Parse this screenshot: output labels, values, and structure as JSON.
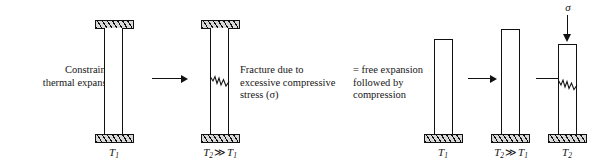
{
  "figure": {
    "background_color": "#ffffff",
    "line_color": "#111111",
    "hatch_fill_color": "#d8d8d8"
  },
  "captions": {
    "constraint": "Constraint of\nthermal expansion",
    "fracture": "Fracture due to\nexcessive compressive\nstress (σ)",
    "equivalence": "= free expansion\nfollowed by\ncompression"
  },
  "stages": [
    {
      "id": "constrained-cold",
      "label_t_symbol": "T",
      "label_t_sub": "1",
      "label_text": "T₁",
      "state": "constrained bar at low temperature, rigid supports top and bottom"
    },
    {
      "id": "constrained-hot-fractured",
      "label_left_symbol": "T",
      "label_left_sub": "2",
      "relation": "≫",
      "label_right_symbol": "T",
      "label_right_sub": "1",
      "label_text": "T₂ ≫ T₁",
      "state": "constrained bar at high temperature with fracture crack"
    },
    {
      "id": "free-cold",
      "label_t_symbol": "T",
      "label_t_sub": "1",
      "label_text": "T₁",
      "state": "free standing bar at low temperature"
    },
    {
      "id": "free-hot-expanded",
      "label_left_symbol": "T",
      "label_left_sub": "2",
      "relation": "≫",
      "label_right_symbol": "T",
      "label_right_sub": "1",
      "label_text": "T₂ ≫ T₁",
      "state": "free standing bar thermally expanded, taller"
    },
    {
      "id": "compressed-hot-fractured",
      "label_t_symbol": "T",
      "label_t_sub": "2",
      "label_text": "T₂",
      "load_symbol": "σ",
      "state": "bar at high temperature compressed by applied stress, fractured"
    }
  ],
  "arrows": [
    {
      "id": "arrow-1",
      "direction": "right",
      "meaning": "leads to"
    },
    {
      "id": "arrow-2",
      "direction": "right",
      "meaning": "free expansion step"
    },
    {
      "id": "arrow-3",
      "direction": "right",
      "meaning": "compression step"
    },
    {
      "id": "load-arrow",
      "direction": "down",
      "meaning": "applied compressive stress sigma"
    }
  ]
}
